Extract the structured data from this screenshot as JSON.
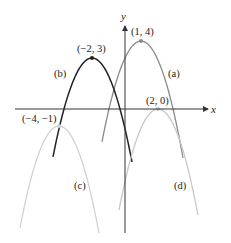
{
  "axes": {
    "x_label": "x",
    "y_label": "y",
    "origin_px": [
      125,
      109
    ],
    "x_range_px": [
      15,
      210
    ],
    "y_range_px": [
      25,
      233
    ],
    "color": "#333333"
  },
  "chart_data": {
    "type": "line",
    "title": "",
    "xlabel": "x",
    "ylabel": "y",
    "series": [
      {
        "name": "(a)",
        "vertex": [
          1,
          4
        ],
        "vertex_label": "(1, 4)",
        "color": "#8a8a8a",
        "shape": "downward parabola"
      },
      {
        "name": "(b)",
        "vertex": [
          -2,
          3
        ],
        "vertex_label": "(−2, 3)",
        "color": "#222222",
        "shape": "downward parabola"
      },
      {
        "name": "(c)",
        "vertex": [
          -4,
          -1
        ],
        "vertex_label": "(−4, −1)",
        "color": "#cfcfcf",
        "shape": "downward parabola"
      },
      {
        "name": "(d)",
        "vertex": [
          2,
          0
        ],
        "vertex_label": "(2, 0)",
        "color": "#c4c4c4",
        "shape": "downward parabola"
      }
    ]
  },
  "curves": [
    {
      "id": "a",
      "label": "(a)",
      "vertex_label": "(1, 4)",
      "vx": 141,
      "vy": 41,
      "x1": 102,
      "x2": 183,
      "k": 0.0663,
      "color": "#8a8a8a",
      "width": 1.3,
      "label_pos": [
        168,
        77
      ],
      "vlabel_pos": [
        131,
        35
      ]
    },
    {
      "id": "b",
      "label": "(b)",
      "vertex_label": "(−2, 3)",
      "vx": 92,
      "vy": 58,
      "x1": 53,
      "x2": 132,
      "k": 0.065,
      "color": "#222222",
      "width": 1.5,
      "label_pos": [
        54,
        77
      ],
      "vlabel_pos": [
        77,
        52
      ]
    },
    {
      "id": "c",
      "label": "(c)",
      "vertex_label": "(−4, −1)",
      "vx": 59,
      "vy": 126,
      "x1": 20,
      "x2": 99,
      "k": 0.067,
      "color": "#d2d2d2",
      "width": 1.3,
      "label_pos": [
        74,
        189
      ],
      "vlabel_pos": [
        22,
        122
      ]
    },
    {
      "id": "d",
      "label": "(d)",
      "vertex_label": "(2, 0)",
      "vx": 158,
      "vy": 109,
      "x1": 119,
      "x2": 198,
      "k": 0.0664,
      "color": "#c8c8c8",
      "width": 1.3,
      "label_pos": [
        174,
        189
      ],
      "vlabel_pos": [
        146,
        104
      ]
    }
  ]
}
